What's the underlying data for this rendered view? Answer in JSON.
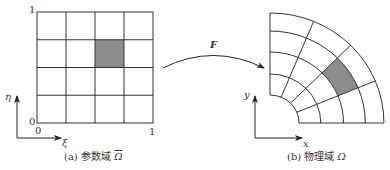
{
  "figure": {
    "colors": {
      "line": "#333333",
      "shade": "#8c8c8c",
      "background": "#ffffff"
    },
    "param_domain": {
      "grid": {
        "rows": 4,
        "cols": 4
      },
      "shaded_cell": {
        "col": 2,
        "row_from_top": 1
      },
      "tick_top": "1",
      "tick_origin_y": "0",
      "tick_origin_x": "0",
      "tick_right": "1",
      "axis_vertical_label": "η",
      "axis_horizontal_label": "ξ",
      "caption_prefix": "(a) 参数域",
      "caption_symbol": "Ω"
    },
    "mapping": {
      "label": "F"
    },
    "physical_domain": {
      "grid": {
        "radial_segments": 4,
        "angular_segments": 4
      },
      "shaded_cell": {
        "radial_index": 2,
        "angular_index": 1
      },
      "axis_vertical_label": "y",
      "axis_horizontal_label": "x",
      "caption_prefix": "(b) 物理域",
      "caption_symbol": "Ω"
    }
  }
}
